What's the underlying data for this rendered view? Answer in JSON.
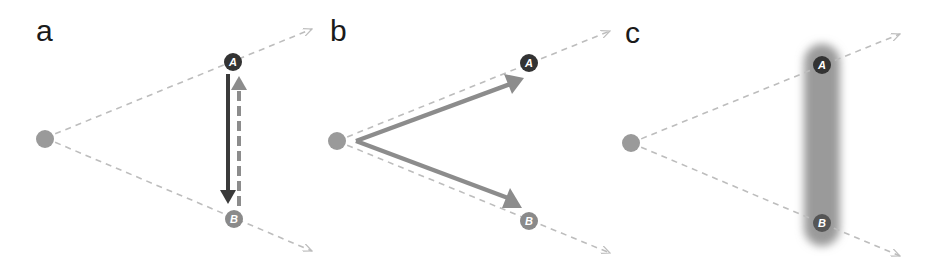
{
  "colors": {
    "background": "#ffffff",
    "ray": "#bdbdbd",
    "origin_dot": "#9a9a9a",
    "node_a": "#333333",
    "node_b": "#8a8a8a",
    "arrow_dark": "#3a3a3a",
    "arrow_light": "#8c8c8c",
    "blur_bar": "#9a9a9a"
  },
  "panels": [
    {
      "label": "a",
      "nodes": {
        "a": "A",
        "b": "B"
      },
      "arrows": [
        {
          "from": "A",
          "to": "B",
          "style": "solid",
          "color": "dark"
        },
        {
          "from": "B",
          "to": "A",
          "style": "dashed",
          "color": "light"
        }
      ]
    },
    {
      "label": "b",
      "nodes": {
        "a": "A",
        "b": "B"
      },
      "arrows": [
        {
          "from": "origin",
          "to": "A",
          "style": "solid",
          "color": "light"
        },
        {
          "from": "origin",
          "to": "B",
          "style": "solid",
          "color": "light"
        }
      ]
    },
    {
      "label": "c",
      "nodes": {
        "a": "A",
        "b": "B"
      },
      "highlight": "blurred vertical bar spanning A and B"
    }
  ]
}
